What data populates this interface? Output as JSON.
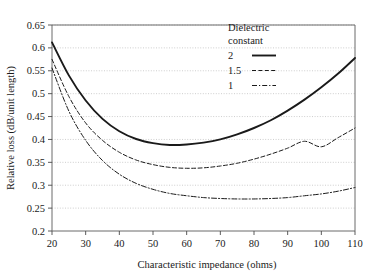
{
  "chart_data": {
    "type": "line",
    "title": "",
    "xlabel": "Characteristic impedance (ohms)",
    "ylabel": "Relative loss (dB/unit length)",
    "xlim": [
      20,
      110
    ],
    "ylim": [
      0.2,
      0.65
    ],
    "xticks": [
      20,
      30,
      40,
      50,
      60,
      70,
      80,
      90,
      100,
      110
    ],
    "yticks": [
      0.2,
      0.25,
      0.3,
      0.35,
      0.4,
      0.45,
      0.5,
      0.55,
      0.6,
      0.65
    ],
    "xtick_labels": [
      "20",
      "30",
      "40",
      "50",
      "60",
      "70",
      "80",
      "90",
      "100",
      "110"
    ],
    "ytick_labels": [
      "0.2",
      "0.25",
      "0.3",
      "0.35",
      "0.4",
      "0.45",
      "0.5",
      "0.55",
      "0.6",
      "0.65"
    ],
    "grid": true,
    "grid_axis": "y",
    "legend_position": "top-right",
    "legend_title": "Dielectric constant",
    "x": [
      20,
      25,
      30,
      35,
      40,
      45,
      50,
      55,
      60,
      65,
      70,
      75,
      80,
      85,
      90,
      95,
      100,
      105,
      110
    ],
    "series": [
      {
        "name": "2",
        "style": "solid",
        "color": "#1a1a1a",
        "values": [
          0.612,
          0.54,
          0.485,
          0.445,
          0.418,
          0.401,
          0.392,
          0.388,
          0.389,
          0.393,
          0.4,
          0.411,
          0.425,
          0.442,
          0.463,
          0.487,
          0.514,
          0.544,
          0.578
        ]
      },
      {
        "name": "1.5",
        "style": "dashed",
        "color": "#1a1a1a",
        "values": [
          0.575,
          0.494,
          0.436,
          0.398,
          0.372,
          0.355,
          0.345,
          0.339,
          0.337,
          0.338,
          0.342,
          0.348,
          0.357,
          0.368,
          0.381,
          0.396,
          0.384,
          0.404,
          0.425
        ]
      },
      {
        "name": "1",
        "style": "dashdot",
        "color": "#1a1a1a",
        "values": [
          0.556,
          0.462,
          0.398,
          0.354,
          0.324,
          0.304,
          0.291,
          0.282,
          0.277,
          0.273,
          0.271,
          0.27,
          0.27,
          0.271,
          0.273,
          0.277,
          0.281,
          0.287,
          0.295
        ]
      }
    ]
  },
  "legend": {
    "title_line1": "Dielectric",
    "title_line2": "constant",
    "entries": [
      {
        "label": "2",
        "style": "solid"
      },
      {
        "label": "1.5",
        "style": "dashed"
      },
      {
        "label": "1",
        "style": "dashdot"
      }
    ]
  },
  "axes": {
    "x_title": "Characteristic impedance (ohms)",
    "y_title": "Relative loss (dB/unit length)"
  }
}
